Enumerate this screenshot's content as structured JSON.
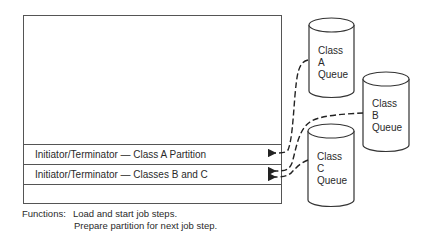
{
  "partition_rows": [
    {
      "label": "Initiator/Terminator — Class A Partition"
    },
    {
      "label": "Initiator/Terminator — Classes B and C"
    },
    {
      "label": ""
    }
  ],
  "queues": [
    {
      "line1": "Class",
      "line2": "A",
      "line3": "Queue"
    },
    {
      "line1": "Class",
      "line2": "B",
      "line3": "Queue"
    },
    {
      "line1": "Class",
      "line2": "C",
      "line3": "Queue"
    }
  ],
  "functions": {
    "label": "Functions:",
    "line1": "Load and start job steps.",
    "line2": "Prepare partition for next job step."
  }
}
